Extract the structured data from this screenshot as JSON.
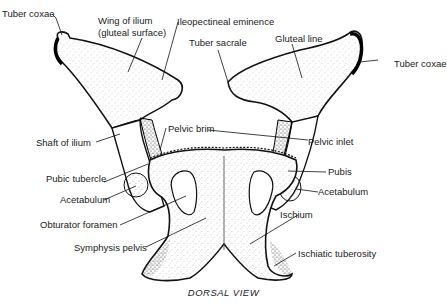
{
  "diagram": {
    "caption": "DORSAL VIEW",
    "labels": {
      "tuber_coxae_left": "Tuber coxae",
      "wing_of_ilium_1": "Wing of ilium",
      "wing_of_ilium_2": "(gluteal surface)",
      "ileopectineal_eminence": "Ileopectineal eminence",
      "tuber_sacrale": "Tuber sacrale",
      "gluteal_line": "Gluteal line",
      "tuber_coxae_right": "Tuber coxae",
      "shaft_of_ilium": "Shaft of ilium",
      "pelvic_brim": "Pelvic brim",
      "pelvic_inlet": "Pelvic inlet",
      "pubic_tubercle": "Pubic tubercle",
      "pubis": "Pubis",
      "acetabulum_left": "Acetabulum",
      "acetabulum_right": "Acetabulum",
      "obturator_foramen": "Obturator foramen",
      "ischium": "Ischium",
      "symphysis_pelvis": "Symphysis pelvis",
      "ischiatic_tuberosity": "Ischiatic tuberosity"
    }
  }
}
